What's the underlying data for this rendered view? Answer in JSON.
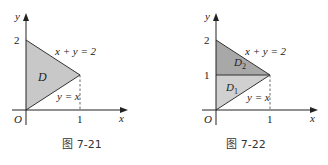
{
  "figures": [
    {
      "id": "left",
      "caption": "图 7-21",
      "axis_x_label": "x",
      "axis_y_label": "y",
      "origin_label": "O",
      "tick_y_2": "2",
      "tick_x_1": "1",
      "line1_label": "x + y = 2",
      "line2_label": "y = x",
      "region_label": "D",
      "region_fill": "#c8c8c8"
    },
    {
      "id": "right",
      "caption": "图 7-22",
      "axis_x_label": "x",
      "axis_y_label": "y",
      "origin_label": "O",
      "tick_y_2": "2",
      "tick_y_1": "1",
      "tick_x_1": "1",
      "line1_label": "x + y = 2",
      "line2_label": "y = x",
      "region_upper_label": "D",
      "region_upper_sub": "2",
      "region_lower_label": "D",
      "region_lower_sub": "1",
      "region_upper_fill": "#a8a8a8",
      "region_lower_fill": "#d0d0d0"
    }
  ]
}
